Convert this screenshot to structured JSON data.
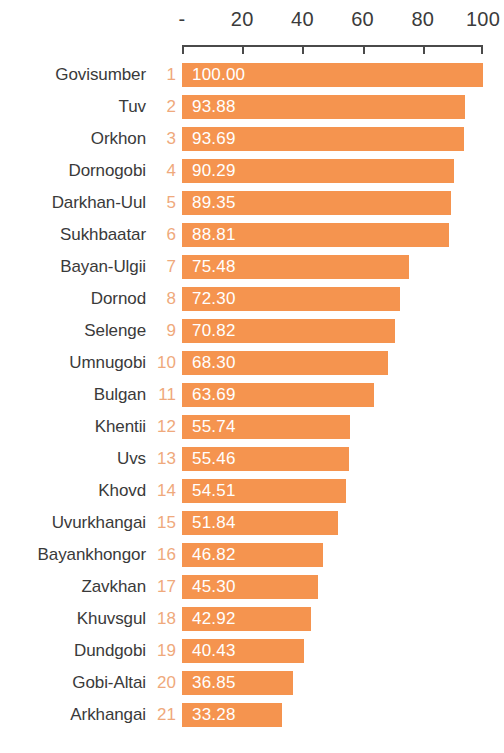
{
  "chart_data": {
    "type": "bar",
    "orientation": "horizontal",
    "title": "",
    "subtitle": "",
    "xlabel": "",
    "ylabel": "",
    "xlim": [
      0,
      100
    ],
    "grid": false,
    "legend": null,
    "axis_tick_labels": [
      "-",
      "20",
      "40",
      "60",
      "80",
      "100"
    ],
    "axis_tick_values": [
      0,
      20,
      40,
      60,
      80,
      100
    ],
    "bar_color": "#f5944f",
    "value_label_color": "#ffffff",
    "rank_color": "#efa97c",
    "category_label_color": "#3a3a3a",
    "categories": [
      "Govisumber",
      "Tuv",
      "Orkhon",
      "Dornogobi",
      "Darkhan-Uul",
      "Sukhbaatar",
      "Bayan-Ulgii",
      "Dornod",
      "Selenge",
      "Umnugobi",
      "Bulgan",
      "Khentii",
      "Uvs",
      "Khovd",
      "Uvurkhangai",
      "Bayankhongor",
      "Zavkhan",
      "Khuvsgul",
      "Dundgobi",
      "Gobi-Altai",
      "Arkhangai"
    ],
    "ranks": [
      1,
      2,
      3,
      4,
      5,
      6,
      7,
      8,
      9,
      10,
      11,
      12,
      13,
      14,
      15,
      16,
      17,
      18,
      19,
      20,
      21
    ],
    "values": [
      100.0,
      93.88,
      93.69,
      90.29,
      89.35,
      88.81,
      75.48,
      72.3,
      70.82,
      68.3,
      63.69,
      55.74,
      55.46,
      54.51,
      51.84,
      46.82,
      45.3,
      42.92,
      40.43,
      36.85,
      33.28
    ],
    "value_labels": [
      "100.00",
      "93.88",
      "93.69",
      "90.29",
      "89.35",
      "88.81",
      "75.48",
      "72.30",
      "70.82",
      "68.30",
      "63.69",
      "55.74",
      "55.46",
      "54.51",
      "51.84",
      "46.82",
      "45.30",
      "42.92",
      "40.43",
      "36.85",
      "33.28"
    ]
  },
  "layout": {
    "plot_left_px": 182,
    "plot_width_px": 301,
    "first_row_top_px": 63,
    "row_pitch_px": 32,
    "bar_height_px": 24
  }
}
